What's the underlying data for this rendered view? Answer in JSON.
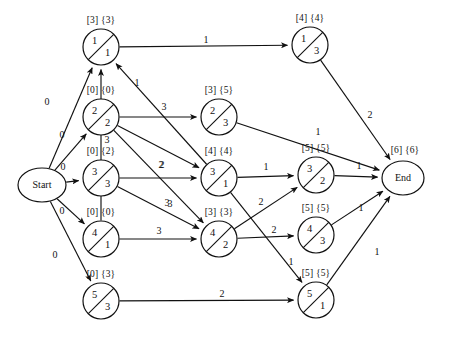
{
  "diagram": {
    "stroke_color": "#111111",
    "background_color": "#ffffff",
    "start_label": "Start",
    "end_label": "End",
    "end_bracket_label": "[6] {6}"
  },
  "nodes": [
    {
      "id": "start",
      "kind": "terminal",
      "label": "Start",
      "cx": 42,
      "cy": 185,
      "r": 21,
      "rx": 24,
      "ry": 17
    },
    {
      "id": "n1a",
      "kind": "split",
      "top": "1",
      "bottom": "1",
      "bracket": "[3] {3}",
      "cx": 101,
      "cy": 47,
      "r": 18
    },
    {
      "id": "n2a",
      "kind": "split",
      "top": "2",
      "bottom": "2",
      "bracket": "[0] {0}",
      "cx": 101,
      "cy": 117,
      "r": 18
    },
    {
      "id": "n3a",
      "kind": "split",
      "top": "3",
      "bottom": "3",
      "bracket": "[0] {2}",
      "cx": 101,
      "cy": 178,
      "r": 18
    },
    {
      "id": "n4a",
      "kind": "split",
      "top": "4",
      "bottom": "1",
      "bracket": "[0] {0}",
      "cx": 101,
      "cy": 239,
      "r": 18
    },
    {
      "id": "n5a",
      "kind": "split",
      "top": "5",
      "bottom": "3",
      "bracket": "[0] {3}",
      "cx": 101,
      "cy": 301,
      "r": 18
    },
    {
      "id": "n2b",
      "kind": "split",
      "top": "2",
      "bottom": "3",
      "bracket": "[3] {5}",
      "cx": 219,
      "cy": 117,
      "r": 18
    },
    {
      "id": "n3b",
      "kind": "split",
      "top": "3",
      "bottom": "1",
      "bracket": "[4] {4}",
      "cx": 219,
      "cy": 178,
      "r": 18
    },
    {
      "id": "n4b",
      "kind": "split",
      "top": "4",
      "bottom": "2",
      "bracket": "[3] {3}",
      "cx": 219,
      "cy": 239,
      "r": 18
    },
    {
      "id": "n1c",
      "kind": "split",
      "top": "1",
      "bottom": "3",
      "bracket": "[4] {4}",
      "cx": 310,
      "cy": 45,
      "r": 18
    },
    {
      "id": "n3c",
      "kind": "split",
      "top": "3",
      "bottom": "2",
      "bracket": "[5] {5}",
      "cx": 316,
      "cy": 175,
      "r": 18
    },
    {
      "id": "n4c",
      "kind": "split",
      "top": "4",
      "bottom": "3",
      "bracket": "[5] {5}",
      "cx": 316,
      "cy": 235,
      "r": 18
    },
    {
      "id": "n5c",
      "kind": "split",
      "top": "5",
      "bottom": "1",
      "bracket": "[5] {5}",
      "cx": 316,
      "cy": 300,
      "r": 18
    },
    {
      "id": "end",
      "kind": "terminal",
      "label": "End",
      "cx": 403,
      "cy": 178,
      "r": 19,
      "rx": 21,
      "ry": 17
    }
  ],
  "edges": [
    {
      "from": "start",
      "to": "n1a",
      "weight": "0",
      "lx": 47,
      "ly": 103
    },
    {
      "from": "start",
      "to": "n2a",
      "weight": "0",
      "lx": 62,
      "ly": 136
    },
    {
      "from": "start",
      "to": "n3a",
      "weight": "0",
      "lx": 63,
      "ly": 168
    },
    {
      "from": "start",
      "to": "n4a",
      "weight": "0",
      "lx": 62,
      "ly": 212
    },
    {
      "from": "start",
      "to": "n5a",
      "weight": "0",
      "lx": 55,
      "ly": 256
    },
    {
      "from": "n1a",
      "to": "n1c",
      "weight": "1",
      "lx": 206,
      "ly": 41
    },
    {
      "from": "n2a",
      "to": "n2b",
      "weight": "3",
      "lx": 164,
      "ly": 108
    },
    {
      "from": "n2a",
      "to": "n3b",
      "weight": "2",
      "lx": 162,
      "ly": 166
    },
    {
      "from": "n2a",
      "to": "n4b",
      "weight": "3",
      "lx": 167,
      "ly": 204
    },
    {
      "from": "n4a",
      "to": "n1a",
      "weight": "3",
      "lx": 107,
      "ly": 141
    },
    {
      "from": "n3b",
      "to": "n1a",
      "weight": "1",
      "lx": 137,
      "ly": 84
    },
    {
      "from": "n3a",
      "to": "n3b",
      "weight": "2",
      "lx": 161,
      "ly": 166
    },
    {
      "from": "n3a",
      "to": "n4b",
      "weight": "3",
      "lx": 170,
      "ly": 205
    },
    {
      "from": "n4a",
      "to": "n4b",
      "weight": "3",
      "lx": 159,
      "ly": 232
    },
    {
      "from": "n5a",
      "to": "n5c",
      "weight": "2",
      "lx": 222,
      "ly": 295
    },
    {
      "from": "n2b",
      "to": "end",
      "weight": "1",
      "lx": 318,
      "ly": 133
    },
    {
      "from": "n1c",
      "to": "end",
      "weight": "2",
      "lx": 370,
      "ly": 116
    },
    {
      "from": "n3b",
      "to": "n3c",
      "weight": "1",
      "lx": 266,
      "ly": 168
    },
    {
      "from": "n3b",
      "to": "n5c",
      "weight": "1",
      "lx": 291,
      "ly": 263
    },
    {
      "from": "n4b",
      "to": "n3c",
      "weight": "2",
      "lx": 261,
      "ly": 203
    },
    {
      "from": "n4b",
      "to": "n4c",
      "weight": "2",
      "lx": 274,
      "ly": 231
    },
    {
      "from": "n3c",
      "to": "end",
      "weight": "1",
      "lx": 359,
      "ly": 167
    },
    {
      "from": "n4c",
      "to": "end",
      "weight": "1",
      "lx": 361,
      "ly": 209
    },
    {
      "from": "n5c",
      "to": "end",
      "weight": "1",
      "lx": 377,
      "ly": 253
    }
  ]
}
